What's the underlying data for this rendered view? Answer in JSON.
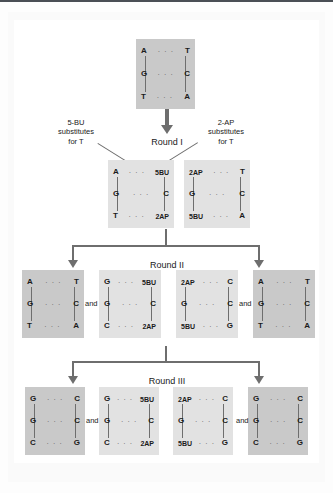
{
  "figure": {
    "callouts": {
      "left": "5-BU\nsubstitutes\nfor T",
      "left_line1": "5-BU",
      "left_line2": "substitutes",
      "left_line3": "for T",
      "right_line1": "2-AP",
      "right_line2": "substitutes",
      "right_line3": "for T"
    },
    "rounds": [
      {
        "label": "Round I"
      },
      {
        "label": "Round II"
      },
      {
        "label": "Round III"
      }
    ],
    "and_label": "and",
    "hbond3": "· · ·",
    "colors": {
      "shade_dark": "#c9c9c9",
      "shade_light": "#e2e2e2",
      "line": "#6e6e6e",
      "text": "#1a1a1a",
      "rule": "#4a4f55"
    },
    "original": {
      "name": "original-duplex",
      "shade": "dark",
      "rows": [
        {
          "left": "A",
          "right": "T"
        },
        {
          "left": "G",
          "right": "C"
        },
        {
          "left": "T",
          "right": "A"
        }
      ]
    },
    "round1": [
      {
        "name": "round1-duplex-1",
        "shade": "light",
        "rows": [
          {
            "left": "A",
            "right": "5BU"
          },
          {
            "left": "G",
            "right": "C"
          },
          {
            "left": "T",
            "right": "2AP"
          }
        ]
      },
      {
        "name": "round1-duplex-2",
        "shade": "light",
        "rows": [
          {
            "left": "2AP",
            "right": "T"
          },
          {
            "left": "G",
            "right": "C"
          },
          {
            "left": "5BU",
            "right": "A"
          }
        ]
      }
    ],
    "round2": [
      {
        "name": "round2-duplex-1",
        "shade": "dark",
        "rows": [
          {
            "left": "A",
            "right": "T"
          },
          {
            "left": "G",
            "right": "C"
          },
          {
            "left": "T",
            "right": "A"
          }
        ]
      },
      {
        "name": "round2-duplex-2",
        "shade": "light",
        "rows": [
          {
            "left": "G",
            "right": "5BU"
          },
          {
            "left": "G",
            "right": "C"
          },
          {
            "left": "C",
            "right": "2AP"
          }
        ]
      },
      {
        "name": "round2-duplex-3",
        "shade": "light",
        "rows": [
          {
            "left": "2AP",
            "right": "C"
          },
          {
            "left": "G",
            "right": "C"
          },
          {
            "left": "5BU",
            "right": "G"
          }
        ]
      },
      {
        "name": "round2-duplex-4",
        "shade": "dark",
        "rows": [
          {
            "left": "A",
            "right": "T"
          },
          {
            "left": "G",
            "right": "C"
          },
          {
            "left": "T",
            "right": "A"
          }
        ]
      }
    ],
    "round3": [
      {
        "name": "round3-duplex-1",
        "shade": "dark",
        "rows": [
          {
            "left": "G",
            "right": "C"
          },
          {
            "left": "G",
            "right": "C"
          },
          {
            "left": "C",
            "right": "G"
          }
        ]
      },
      {
        "name": "round3-duplex-2",
        "shade": "light",
        "rows": [
          {
            "left": "G",
            "right": "5BU"
          },
          {
            "left": "G",
            "right": "C"
          },
          {
            "left": "C",
            "right": "2AP"
          }
        ]
      },
      {
        "name": "round3-duplex-3",
        "shade": "light",
        "rows": [
          {
            "left": "2AP",
            "right": "C"
          },
          {
            "left": "G",
            "right": "C"
          },
          {
            "left": "5BU",
            "right": "G"
          }
        ]
      },
      {
        "name": "round3-duplex-4",
        "shade": "dark",
        "rows": [
          {
            "left": "G",
            "right": "C"
          },
          {
            "left": "G",
            "right": "C"
          },
          {
            "left": "C",
            "right": "G"
          }
        ]
      }
    ]
  }
}
